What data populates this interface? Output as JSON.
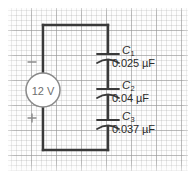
{
  "figure": {
    "type": "circuit-diagram",
    "background": "graph-paper",
    "colors": {
      "wire": "#3a3a3a",
      "grid_major": "#969696",
      "grid_minor": "#afafaf",
      "source_outline": "#8a8a8a",
      "text": "#2b2b2b",
      "source_text": "#6e6e6e",
      "page": "#ffffff"
    }
  },
  "source": {
    "label": "12 V",
    "voltage": 12,
    "unit": "V",
    "terminal_top": "−",
    "terminal_bottom": "+"
  },
  "capacitors": [
    {
      "name": "C",
      "subscript": "1",
      "value": "0.025 µF",
      "capacitance": 0.025,
      "unit": "µF"
    },
    {
      "name": "C",
      "subscript": "2",
      "value": "0.04 µF",
      "capacitance": 0.04,
      "unit": "µF"
    },
    {
      "name": "C",
      "subscript": "3",
      "value": "0.037 µF",
      "capacitance": 0.037,
      "unit": "µF"
    }
  ]
}
